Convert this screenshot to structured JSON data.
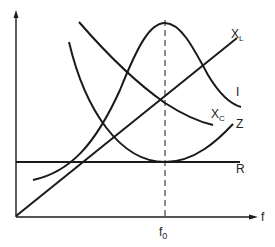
{
  "diagram": {
    "x_axis_label": "f",
    "resonance_label_main": "f",
    "resonance_label_sub": "0",
    "curves": [
      {
        "id": "XL",
        "label_main": "X",
        "label_sub": "L",
        "description": "Inductive reactance, increases linearly with frequency"
      },
      {
        "id": "I",
        "label_main": "I",
        "description": "Current, peaks at resonance frequency f0"
      },
      {
        "id": "XC",
        "label_main": "X",
        "label_sub": "C",
        "description": "Capacitive reactance, decreases with frequency"
      },
      {
        "id": "Z",
        "label_main": "Z",
        "description": "Impedance, minimum (equal to R) at f0"
      },
      {
        "id": "R",
        "label_main": "R",
        "description": "Resistance, constant with frequency"
      }
    ],
    "colors": {
      "line": "#1a1a1a",
      "background": "#ffffff"
    }
  }
}
